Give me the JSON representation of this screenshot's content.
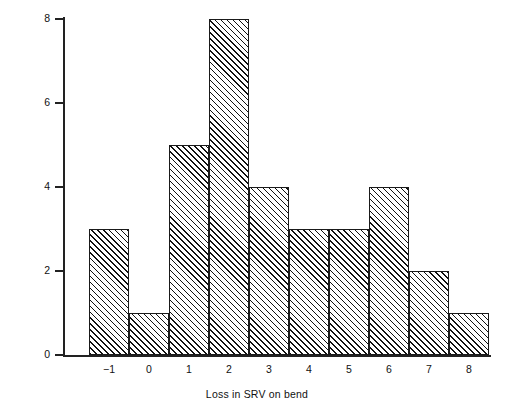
{
  "chart_data": {
    "type": "bar",
    "title": "",
    "subtitle": "",
    "xlabel": "Loss in SRV on bend",
    "ylabel": "Number of results",
    "categories": [
      "-1",
      "0",
      "1",
      "2",
      "3",
      "4",
      "5",
      "6",
      "7",
      "8"
    ],
    "values": [
      3,
      1,
      5,
      8,
      4,
      3,
      3,
      4,
      2,
      1
    ],
    "xtick_labels": [
      "−1",
      "0",
      "1",
      "2",
      "3",
      "4",
      "5",
      "6",
      "7",
      "8"
    ],
    "ytick_labels": [
      "0",
      "2",
      "4",
      "6",
      "8"
    ],
    "ytick_values": [
      0,
      2,
      4,
      6,
      8
    ],
    "ylim": [
      0,
      8
    ],
    "grid": false,
    "legend": false,
    "legend_position": "none",
    "bar_style": {
      "fill": "diagonal-hatch",
      "hatch_angle_deg": 45,
      "edge_color": "#1a1a1a",
      "face_color": "#ffffff",
      "gap": 0
    },
    "annotations": []
  },
  "axes": {
    "y_label": "Number of results",
    "x_label": "Loss in SRV on bend"
  }
}
